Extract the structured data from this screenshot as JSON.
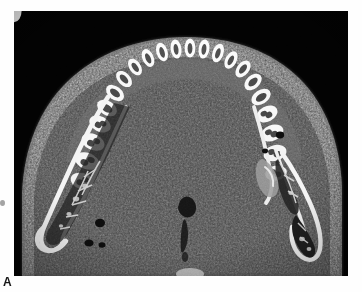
{
  "figure": {
    "panel_label": "A",
    "modality": "CT",
    "plane": "axial",
    "anatomy": "mandible"
  },
  "image": {
    "background_color": "#020202",
    "soft_tissue_color": "#3c3c3c",
    "cortical_bone_color": "#f2f2f2",
    "trabecular_color": "#4a4a4a",
    "marrow_color": "#1c1c1c",
    "enamel_color": "#fbfbfb",
    "pulp_color": "#414141",
    "border_color": "#d8d8d8",
    "width_px": 334,
    "height_px": 265,
    "offset_x_px": 14,
    "offset_y_px": 11
  },
  "anatomy_structures": [
    {
      "name": "dental-arch",
      "label": "Dental arch"
    },
    {
      "name": "left-mandibular-ramus",
      "label": "Left mandibular ramus"
    },
    {
      "name": "right-mandibular-ramus",
      "label": "Right mandibular ramus"
    },
    {
      "name": "midline-airway",
      "label": "Midline airway"
    },
    {
      "name": "soft-tissue-envelope",
      "label": "Soft tissue envelope"
    }
  ],
  "teeth": {
    "arch_count": 17,
    "note": "Teeth shown in axial cross-section with visible pulp chambers"
  }
}
